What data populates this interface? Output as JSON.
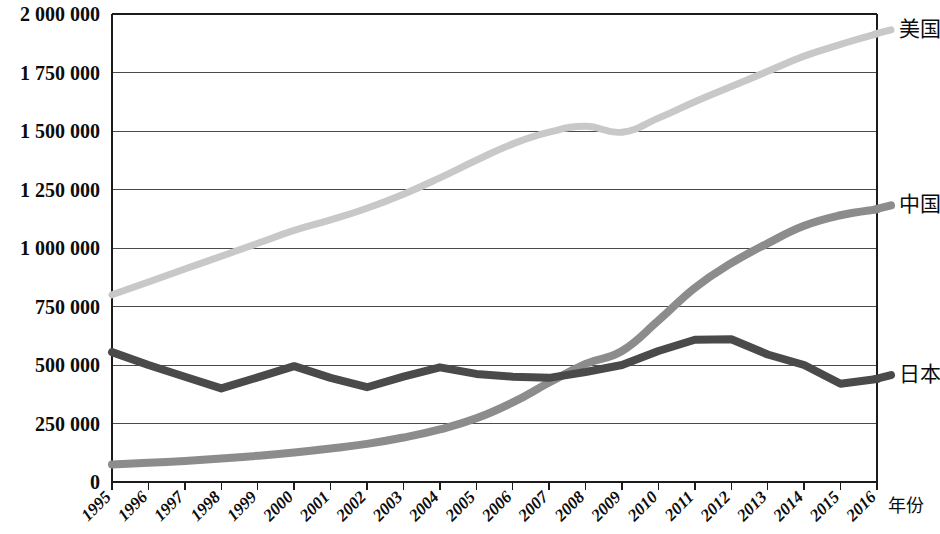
{
  "chart_data": {
    "type": "line",
    "title": "",
    "subtitle": "",
    "xlabel": "年份",
    "ylabel": "",
    "grid": true,
    "legend_position": "right-inline-end-of-line",
    "x": [
      1995,
      1996,
      1997,
      1998,
      1999,
      2000,
      2001,
      2002,
      2003,
      2004,
      2005,
      2006,
      2007,
      2008,
      2009,
      2010,
      2011,
      2012,
      2013,
      2014,
      2015,
      2016
    ],
    "categories": [
      "1995",
      "1996",
      "1997",
      "1998",
      "1999",
      "2000",
      "2001",
      "2002",
      "2003",
      "2004",
      "2005",
      "2006",
      "2007",
      "2008",
      "2009",
      "2010",
      "2011",
      "2012",
      "2013",
      "2014",
      "2015",
      "2016"
    ],
    "xlim": [
      1995,
      2016
    ],
    "ylim": [
      0,
      2000000
    ],
    "ytick_values": [
      0,
      250000,
      500000,
      750000,
      1000000,
      1250000,
      1500000,
      1750000,
      2000000
    ],
    "ytick_labels": [
      "0",
      "250 000",
      "500 000",
      "750 000",
      "1 000 000",
      "1 250 000",
      "1 500 000",
      "1 750 000",
      "2 000 000"
    ],
    "series": [
      {
        "name": "美国",
        "color": "#c8c8c8",
        "width": 7,
        "label_x": 2016,
        "values": [
          800000,
          855000,
          910000,
          965000,
          1020000,
          1075000,
          1120000,
          1170000,
          1230000,
          1300000,
          1375000,
          1445000,
          1495000,
          1520000,
          1495000,
          1555000,
          1625000,
          1690000,
          1755000,
          1820000,
          1870000,
          1915000
        ]
      },
      {
        "name": "中国",
        "color": "#8c8c8c",
        "width": 8,
        "label_x": 2016,
        "values": [
          75000,
          82000,
          90000,
          100000,
          112000,
          126000,
          143000,
          163000,
          190000,
          225000,
          272000,
          340000,
          425000,
          505000,
          560000,
          690000,
          830000,
          935000,
          1020000,
          1095000,
          1140000,
          1165000
        ]
      },
      {
        "name": "日本",
        "color": "#4a4a4a",
        "width": 8,
        "label_x": 2016,
        "values": [
          555000,
          500000,
          450000,
          400000,
          447000,
          495000,
          445000,
          405000,
          450000,
          490000,
          462000,
          450000,
          445000,
          470000,
          500000,
          560000,
          608000,
          610000,
          545000,
          500000,
          420000,
          440000
        ]
      }
    ]
  },
  "axes": {
    "x_axis_title": "年份",
    "y_axis_title": ""
  },
  "plot_area": {
    "left": 112,
    "top": 14,
    "right": 877,
    "bottom": 482
  },
  "colors": {
    "background": "#ffffff",
    "gridline": "#4b4b4b",
    "axis": "#1b1b1b",
    "text": "#0c0c0c",
    "series_us": "#c8c8c8",
    "series_cn": "#8c8c8c",
    "series_jp": "#4a4a4a"
  }
}
